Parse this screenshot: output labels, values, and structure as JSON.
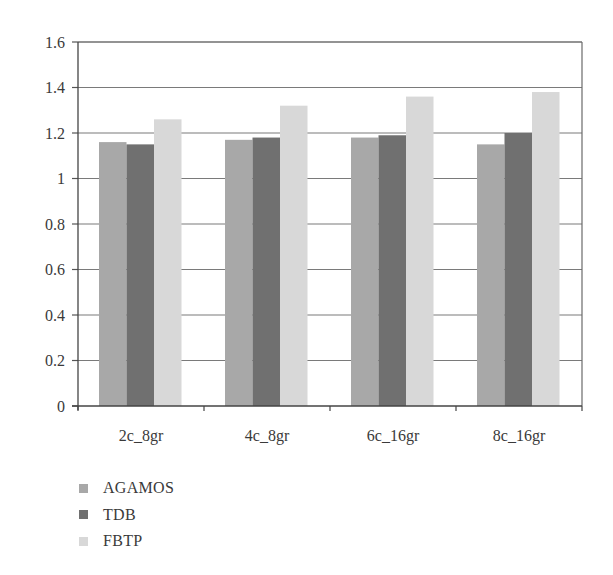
{
  "chart_data": {
    "type": "bar",
    "title": "",
    "xlabel": "",
    "ylabel": "",
    "categories": [
      "2c_8gr",
      "4c_8gr",
      "6c_16gr",
      "8c_16gr"
    ],
    "series": [
      {
        "name": "AGAMOS",
        "color": "#a8a8a8",
        "values": [
          1.16,
          1.17,
          1.18,
          1.15
        ]
      },
      {
        "name": "TDB",
        "color": "#707070",
        "values": [
          1.15,
          1.18,
          1.19,
          1.2
        ]
      },
      {
        "name": "FBTP",
        "color": "#d8d8d8",
        "values": [
          1.26,
          1.32,
          1.36,
          1.38
        ]
      }
    ],
    "ylim": [
      0,
      1.6
    ],
    "yticks": [
      0,
      0.2,
      0.4,
      0.6,
      0.8,
      1,
      1.2,
      1.4,
      1.6
    ],
    "ytick_labels": [
      "0",
      "0.2",
      "0.4",
      "0.6",
      "0.8",
      "1",
      "1.2",
      "1.4",
      "1.6"
    ],
    "grid": true,
    "legend_position": "bottom-left"
  }
}
